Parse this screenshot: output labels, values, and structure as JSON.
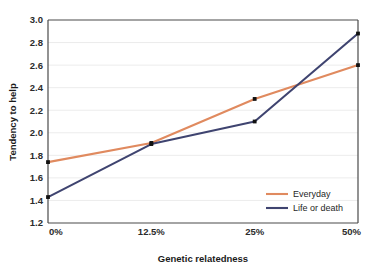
{
  "chart_data": {
    "type": "line",
    "title": "",
    "xlabel": "Genetic relatedness",
    "ylabel": "Tendency to help",
    "categories": [
      "0%",
      "12.5%",
      "25%",
      "50%"
    ],
    "x": [
      0,
      12.5,
      25,
      50
    ],
    "xtick_labels": [
      "0%",
      "12.5%",
      "25%",
      "50%"
    ],
    "ytick_labels": [
      "1.2",
      "1.4",
      "1.6",
      "1.8",
      "2.0",
      "2.2",
      "2.4",
      "2.6",
      "2.8",
      "3.0"
    ],
    "ylim": [
      1.2,
      3.0
    ],
    "ytick_step": 0.2,
    "grid": "horizontal",
    "legend_position": "bottom-right",
    "series": [
      {
        "name": "Everyday",
        "color": "#E08A5F",
        "values": [
          1.74,
          1.91,
          2.3,
          2.6
        ]
      },
      {
        "name": "Life or death",
        "color": "#3F4470",
        "values": [
          1.43,
          1.9,
          2.1,
          2.88
        ]
      }
    ]
  },
  "axes": {
    "y_title": "Tendency to help",
    "x_title": "Genetic relatedness"
  },
  "legend": {
    "items": [
      {
        "label": "Everyday",
        "color": "#E08A5F"
      },
      {
        "label": "Life or death",
        "color": "#3F4470"
      }
    ]
  },
  "yticks": [
    {
      "label": "3.0",
      "value": 3.0
    },
    {
      "label": "2.8",
      "value": 2.8
    },
    {
      "label": "2.6",
      "value": 2.6
    },
    {
      "label": "2.4",
      "value": 2.4
    },
    {
      "label": "2.2",
      "value": 2.2
    },
    {
      "label": "2.0",
      "value": 2.0
    },
    {
      "label": "1.8",
      "value": 1.8
    },
    {
      "label": "1.6",
      "value": 1.6
    },
    {
      "label": "1.4",
      "value": 1.4
    },
    {
      "label": "1.2",
      "value": 1.2
    }
  ],
  "xticks": [
    {
      "label": "0%",
      "value": 0
    },
    {
      "label": "12.5%",
      "value": 12.5
    },
    {
      "label": "25%",
      "value": 25
    },
    {
      "label": "50%",
      "value": 50
    }
  ],
  "colors": {
    "everyday": "#E08A5F",
    "life_or_death": "#3F4470",
    "axis": "#4a4a4a",
    "grid": "#ececec",
    "marker": "#111111",
    "background": "#ffffff"
  }
}
